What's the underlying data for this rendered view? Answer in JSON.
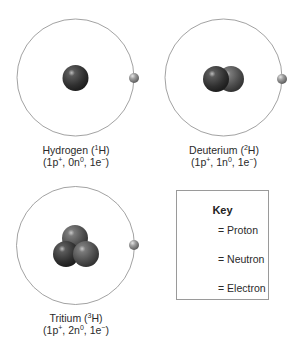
{
  "figure": {
    "colors": {
      "orbit": "#8a8a8a",
      "proton": "#3a3a3a",
      "neutron": "#5c5c5c",
      "electron": "#8f8f8f",
      "key_border": "#9a9a9a"
    },
    "atoms": [
      {
        "name": "Hydrogen",
        "symbol_mass": "1",
        "symbol": "H",
        "composition": {
          "protons": "1p",
          "proton_sign": "+",
          "neutrons": "0n",
          "neutron_sign": "0",
          "electrons": "1e",
          "electron_sign": "−"
        },
        "proton_count": 1,
        "neutron_count": 0,
        "electron_count": 1
      },
      {
        "name": "Deuterium",
        "symbol_mass": "2",
        "symbol": "H",
        "composition": {
          "protons": "1p",
          "proton_sign": "+",
          "neutrons": "1n",
          "neutron_sign": "0",
          "electrons": "1e",
          "electron_sign": "−"
        },
        "proton_count": 1,
        "neutron_count": 1,
        "electron_count": 1
      },
      {
        "name": "Tritium",
        "symbol_mass": "3",
        "symbol": "H",
        "composition": {
          "protons": "1p",
          "proton_sign": "+",
          "neutrons": "2n",
          "neutron_sign": "0",
          "electrons": "1e",
          "electron_sign": "−"
        },
        "proton_count": 1,
        "neutron_count": 2,
        "electron_count": 1
      }
    ],
    "key": {
      "title": "Key",
      "items": [
        {
          "particle": "proton",
          "label": "= Proton"
        },
        {
          "particle": "neutron",
          "label": "= Neutron"
        },
        {
          "particle": "electron",
          "label": "= Electron"
        }
      ]
    }
  }
}
